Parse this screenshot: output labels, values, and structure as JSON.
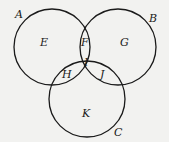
{
  "diagram": {
    "type": "venn",
    "circles": [
      {
        "label": "A",
        "cx": 52,
        "cy": 47,
        "r": 38
      },
      {
        "label": "B",
        "cx": 118,
        "cy": 47,
        "r": 38
      },
      {
        "label": "C",
        "cx": 87,
        "cy": 99,
        "r": 38
      }
    ],
    "regions": [
      {
        "label": "E",
        "x": 44,
        "y": 45
      },
      {
        "label": "F",
        "x": 85,
        "y": 46
      },
      {
        "label": "G",
        "x": 125,
        "y": 46
      },
      {
        "label": "H",
        "x": 67,
        "y": 77
      },
      {
        "label": "I",
        "x": 86,
        "y": 65
      },
      {
        "label": "J",
        "x": 104,
        "y": 77
      },
      {
        "label": "K",
        "x": 86,
        "y": 116
      }
    ],
    "stroke_color": "#1a1a1a",
    "background_color": "#f2f2f0"
  }
}
